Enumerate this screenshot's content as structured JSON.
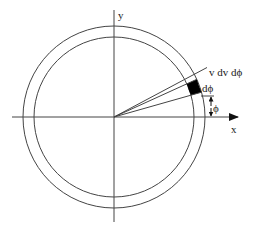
{
  "diagram": {
    "axes": {
      "x_label": "x",
      "y_label": "y"
    },
    "labels": {
      "element": "v dv dϕ",
      "dphi": "dϕ",
      "phi": "ϕ"
    },
    "geometry": {
      "center": [
        114,
        117
      ],
      "inner_radius": 80,
      "outer_radius": 91,
      "ray_angles_deg": [
        15.8,
        24.5,
        30.4
      ],
      "element_span_deg": [
        15.8,
        24.5
      ]
    },
    "colors": {
      "line": "#444444",
      "element_fill": "#000000",
      "background": "#ffffff"
    }
  }
}
